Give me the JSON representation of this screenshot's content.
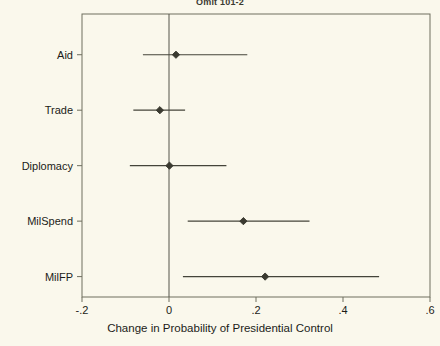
{
  "chart_data": {
    "type": "scatter",
    "subtype": "coefficient-plot-with-confidence-intervals",
    "title": "Omit 101-2",
    "xlabel": "Change in Probability of Presidential Control",
    "ylabel": "",
    "xlim": [
      -0.2,
      0.6
    ],
    "xticks": [
      -0.2,
      0,
      0.2,
      0.4,
      0.6
    ],
    "xticklabels": [
      "-.2",
      "0",
      ".2",
      ".4",
      ".6"
    ],
    "categories": [
      "Aid",
      "Trade",
      "Diplomacy",
      "MilSpend",
      "MilFP"
    ],
    "grid": false,
    "legend": false,
    "reference_line": 0,
    "marker": "filled-diamond",
    "series": [
      {
        "name": "Change in Probability of Presidential Control",
        "estimates": [
          0.016,
          -0.021,
          0.001,
          0.171,
          0.221
        ],
        "ci_low": [
          -0.06,
          -0.082,
          -0.09,
          0.043,
          0.032
        ],
        "ci_high": [
          0.18,
          0.037,
          0.132,
          0.323,
          0.483
        ]
      }
    ],
    "points": [
      {
        "label": "Aid",
        "estimate": 0.016,
        "ci_low": -0.06,
        "ci_high": 0.18
      },
      {
        "label": "Trade",
        "estimate": -0.021,
        "ci_low": -0.082,
        "ci_high": 0.037
      },
      {
        "label": "Diplomacy",
        "estimate": 0.001,
        "ci_low": -0.09,
        "ci_high": 0.132
      },
      {
        "label": "MilSpend",
        "estimate": 0.171,
        "ci_low": 0.043,
        "ci_high": 0.323
      },
      {
        "label": "MilFP",
        "estimate": 0.221,
        "ci_low": 0.032,
        "ci_high": 0.483
      }
    ],
    "colors": {
      "background": "#faf8ec",
      "frame": "#6e6e5e",
      "line": "#44443a",
      "marker": "#3a3a30",
      "text": "#1c1c18",
      "reference_line": "#55554a"
    }
  }
}
